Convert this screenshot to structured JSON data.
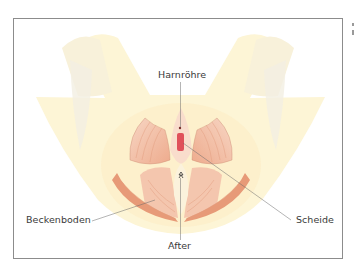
{
  "figure": {
    "type": "anatomical-illustration",
    "labels": {
      "urethra": "Harnröhre",
      "pelvic_floor": "Beckenboden",
      "vagina": "Scheide",
      "anus": "After"
    },
    "colors": {
      "frame_border": "#8c8c8c",
      "background_shape": "#fdf5d6",
      "background_shape_shade": "#f6f0dc",
      "muscle_light": "#f5cdb8",
      "muscle_mid": "#eeac8c",
      "muscle_dark": "#e48c6a",
      "organ_red": "#e0505a",
      "leader_line": "#6a6a6a",
      "label_text": "#3a3a3a"
    }
  }
}
